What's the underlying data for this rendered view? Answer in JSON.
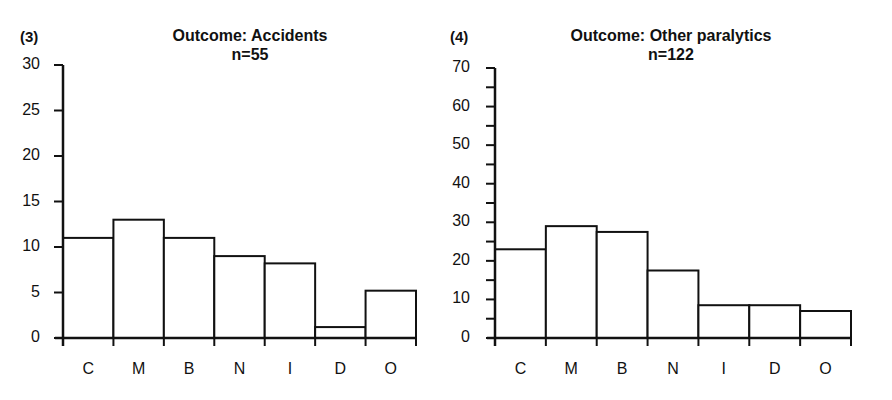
{
  "chart_data": [
    {
      "type": "bar",
      "panel_label": "(3)",
      "title": "Outcome: Accidents",
      "subtitle": "n=55",
      "categories": [
        "C",
        "M",
        "B",
        "N",
        "I",
        "D",
        "O"
      ],
      "values": [
        11,
        13,
        11,
        9,
        8.2,
        1.2,
        5.2
      ],
      "xlabel": "",
      "ylabel": "",
      "ylim": [
        0,
        30
      ],
      "yticks": [
        0,
        5,
        10,
        15,
        20,
        25,
        30
      ],
      "grid": false,
      "legend": null
    },
    {
      "type": "bar",
      "panel_label": "(4)",
      "title": "Outcome: Other paralytics",
      "subtitle": "n=122",
      "categories": [
        "C",
        "M",
        "B",
        "N",
        "I",
        "D",
        "O"
      ],
      "values": [
        23,
        29,
        27.5,
        17.5,
        8.5,
        8.5,
        7
      ],
      "xlabel": "",
      "ylabel": "",
      "ylim": [
        0,
        70
      ],
      "yticks": [
        0,
        10,
        20,
        30,
        40,
        50,
        60,
        70
      ],
      "minor_yticks": [
        5,
        15,
        25,
        35,
        45,
        55,
        65
      ],
      "grid": false,
      "legend": null
    }
  ]
}
